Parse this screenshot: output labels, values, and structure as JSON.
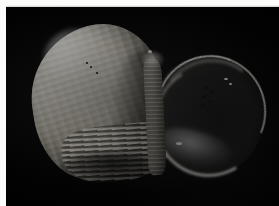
{
  "page": {
    "width": 279,
    "height": 206,
    "background_color": "#fcfcfa",
    "header_remnant_text": "",
    "plate": {
      "background_color": "#000000",
      "left": 6,
      "top": 7,
      "width": 273,
      "height": 199
    }
  },
  "subject": {
    "name": "snail-shell",
    "description": "Photograph of a gastropod snail shell on a black background, aperture facing right",
    "parts": {
      "spire_label": "ribbed pale spire",
      "aperture_label": "dark glossy aperture",
      "columella_label": "columellar wall",
      "base_label": "banded shell base"
    },
    "colors": {
      "shell_light": "#e9e6dd",
      "shell_mid": "#b9b5a8",
      "shell_dark": "#6e6a60",
      "aperture_dark": "#0a0a0a",
      "rim_highlight": "#f4f2ec",
      "background": "#000000"
    }
  },
  "caption": {
    "signature_text": "",
    "signature_visible": true
  },
  "speckles": [
    {
      "x": 204,
      "y": 86,
      "w": 5,
      "h": 3,
      "r": -28
    },
    {
      "x": 210,
      "y": 91,
      "w": 4,
      "h": 3,
      "r": -22
    },
    {
      "x": 202,
      "y": 95,
      "w": 5,
      "h": 3,
      "r": -30
    },
    {
      "x": 208,
      "y": 100,
      "w": 4,
      "h": 3,
      "r": -18
    },
    {
      "x": 200,
      "y": 104,
      "w": 5,
      "h": 3,
      "r": -26
    },
    {
      "x": 206,
      "y": 110,
      "w": 4,
      "h": 2,
      "r": -20
    },
    {
      "x": 213,
      "y": 106,
      "w": 3,
      "h": 2,
      "r": -20
    },
    {
      "x": 86,
      "y": 62,
      "w": 2,
      "h": 2,
      "r": 0
    },
    {
      "x": 90,
      "y": 66,
      "w": 2,
      "h": 2,
      "r": 0
    },
    {
      "x": 96,
      "y": 72,
      "w": 2,
      "h": 2,
      "r": 0
    }
  ],
  "glints": [
    {
      "x": 224,
      "y": 78,
      "w": 4,
      "h": 2
    },
    {
      "x": 229,
      "y": 83,
      "w": 3,
      "h": 2
    },
    {
      "x": 176,
      "y": 142,
      "w": 6,
      "h": 3
    },
    {
      "x": 148,
      "y": 50,
      "w": 4,
      "h": 3
    }
  ]
}
